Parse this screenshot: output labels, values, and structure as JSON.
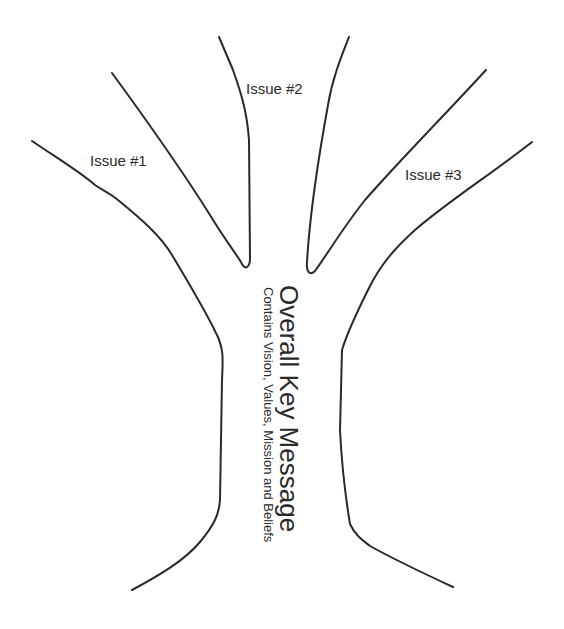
{
  "diagram": {
    "type": "message-tree",
    "trunk": {
      "title": "Overall Key Message",
      "subtitle": "Contains Vision, Values, Mission and Beliefs"
    },
    "branches": [
      {
        "label": "Issue #1"
      },
      {
        "label": "Issue #2"
      },
      {
        "label": "Issue #3"
      }
    ],
    "colors": {
      "line": "#2a2a2a",
      "text": "#2a2a2a",
      "background": "#ffffff"
    }
  }
}
